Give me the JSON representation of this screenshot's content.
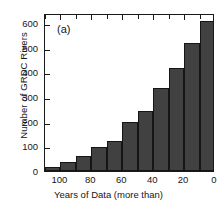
{
  "chart_data": {
    "type": "bar",
    "title": "",
    "panel_label": "(a)",
    "xlabel": "Years of Data (more than)",
    "ylabel": "Number of GRDC Rivers",
    "xlim": [
      110,
      0
    ],
    "ylim": [
      0,
      640
    ],
    "x_axis_inverted": true,
    "grid": false,
    "legend": null,
    "bar_color": "#414141",
    "bar_edge_color": "#151515",
    "xticks": [
      100,
      80,
      60,
      40,
      20,
      0
    ],
    "xtick_labels": [
      "100",
      "80",
      "60",
      "40",
      "20",
      "0"
    ],
    "yticks": [
      0,
      100,
      200,
      300,
      400,
      500,
      600
    ],
    "ytick_labels": [
      "0",
      "100",
      "200",
      "300",
      "400",
      "500",
      "600"
    ],
    "bin_width": 10,
    "categories": [
      "105",
      "95",
      "85",
      "75",
      "65",
      "55",
      "45",
      "35",
      "25",
      "15",
      "5"
    ],
    "bin_edges": [
      110,
      100,
      90,
      80,
      70,
      60,
      50,
      40,
      30,
      20,
      10,
      0
    ],
    "values": [
      15,
      35,
      60,
      98,
      123,
      198,
      242,
      335,
      418,
      518,
      608
    ]
  }
}
